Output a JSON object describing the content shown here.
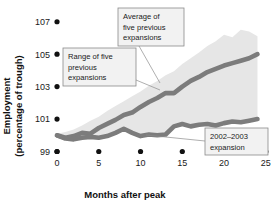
{
  "chart_data": {
    "type": "line",
    "title": "",
    "xlabel": "Months after peak",
    "ylabel": "Employment (percentage of trough)",
    "xlim": [
      -1.2,
      25.5
    ],
    "ylim": [
      98.6,
      107.6
    ],
    "xticks": [
      0,
      5,
      10,
      15,
      20,
      25
    ],
    "xtick_labels": [
      "0",
      "5",
      "10",
      "15",
      "20",
      "25"
    ],
    "yticks": [
      99,
      101,
      103,
      105,
      107
    ],
    "ytick_labels": [
      "99",
      "101",
      "103",
      "105",
      "107"
    ],
    "grid": false,
    "legend": "annotations",
    "x": [
      0,
      1,
      2,
      3,
      4,
      5,
      6,
      7,
      8,
      9,
      10,
      11,
      12,
      13,
      14,
      15,
      16,
      17,
      18,
      19,
      20,
      21,
      22,
      23,
      24
    ],
    "series": [
      {
        "name": "Average of five previous expansions",
        "type": "line",
        "color": "#7c7c7c",
        "values": [
          100.0,
          99.85,
          99.95,
          100.15,
          100.1,
          100.45,
          100.7,
          100.95,
          101.25,
          101.4,
          101.75,
          102.05,
          102.3,
          102.6,
          102.6,
          103.0,
          103.35,
          103.6,
          103.9,
          104.1,
          104.3,
          104.45,
          104.6,
          104.75,
          105.0
        ]
      },
      {
        "name": "2002-2003 expansion",
        "type": "line",
        "color": "#7c7c7c",
        "values": [
          100.0,
          99.8,
          99.75,
          99.85,
          99.9,
          99.85,
          99.95,
          100.15,
          100.4,
          100.15,
          99.95,
          100.05,
          100.0,
          100.05,
          100.55,
          100.7,
          100.55,
          100.65,
          100.7,
          100.6,
          100.75,
          100.85,
          100.8,
          100.9,
          101.0
        ]
      }
    ],
    "band": {
      "name": "Range of five previous expansions",
      "color": "#e6e6e6",
      "upper": [
        100.1,
        100.2,
        100.35,
        100.6,
        100.9,
        101.15,
        101.5,
        101.8,
        102.1,
        102.4,
        102.7,
        103.05,
        103.35,
        103.7,
        103.95,
        104.4,
        104.75,
        105.1,
        105.5,
        105.8,
        106.2,
        106.05,
        106.5,
        106.4,
        106.1
      ],
      "lower": [
        99.9,
        99.7,
        99.65,
        99.75,
        99.8,
        99.75,
        99.85,
        100.05,
        100.3,
        100.05,
        99.85,
        99.95,
        99.9,
        99.95,
        100.45,
        100.6,
        100.45,
        100.55,
        100.6,
        100.5,
        100.65,
        100.75,
        100.7,
        100.8,
        100.9
      ]
    },
    "annotations": [
      {
        "id": "average-callout",
        "text_lines": [
          "Average of",
          "five previous",
          "expansions"
        ],
        "box": {
          "x": 118,
          "y": 8,
          "w": 66,
          "h": 38
        },
        "leader": [
          [
            139,
            46
          ],
          [
            160,
            83
          ]
        ]
      },
      {
        "id": "range-callout",
        "text_lines": [
          "Range of five",
          "previous",
          "expansions"
        ],
        "box": {
          "x": 63,
          "y": 48,
          "w": 73,
          "h": 38
        },
        "leader": [
          [
            136,
            80
          ],
          [
            160,
            90
          ]
        ]
      },
      {
        "id": "expansion-callout",
        "text_lines": [
          "2002–2003",
          "expansion"
        ],
        "box": {
          "x": 205,
          "y": 128,
          "w": 63,
          "h": 27
        },
        "leader": [
          [
            205,
            141
          ],
          [
            146,
            135
          ]
        ]
      }
    ]
  },
  "axis": {
    "y_title_line1": "Employment",
    "y_title_line2": "(percentage of trough)",
    "x_title": "Months after peak"
  }
}
